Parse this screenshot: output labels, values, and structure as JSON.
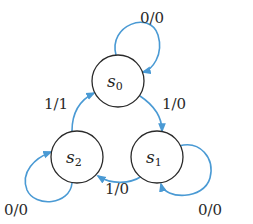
{
  "diagram": {
    "type": "finite-state-machine",
    "edge_color": "#4a9ad4",
    "node_stroke": "#2a2a2a",
    "states": [
      {
        "id": "s0",
        "base": "s",
        "sub": "0"
      },
      {
        "id": "s1",
        "base": "s",
        "sub": "1"
      },
      {
        "id": "s2",
        "base": "s",
        "sub": "2"
      }
    ],
    "transitions": [
      {
        "from": "s0",
        "to": "s0",
        "label": "0/0"
      },
      {
        "from": "s0",
        "to": "s1",
        "label": "1/0"
      },
      {
        "from": "s1",
        "to": "s1",
        "label": "0/0"
      },
      {
        "from": "s1",
        "to": "s2",
        "label": "1/0"
      },
      {
        "from": "s2",
        "to": "s2",
        "label": "0/0"
      },
      {
        "from": "s2",
        "to": "s0",
        "label": "1/1"
      }
    ]
  }
}
